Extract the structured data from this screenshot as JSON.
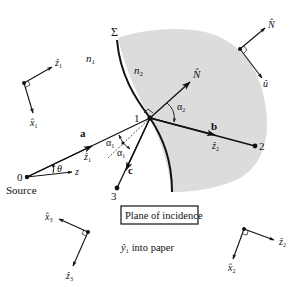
{
  "colors": {
    "ink": "#111111",
    "medium2_fill": "#dcdcdc"
  },
  "labels": {
    "sigma": "Σ",
    "n1": "n",
    "n1_sub": "1",
    "n2": "n",
    "n2_sub": "2",
    "point0": "0",
    "point1": "1",
    "point2": "2",
    "point3": "3",
    "source": "Source",
    "vec_a": "a",
    "vec_b": "b",
    "vec_c": "c",
    "z1_hat": "ẑ",
    "z1_sub": "1",
    "z2_hat": "ẑ",
    "z2_sub": "2",
    "z_axis": "z",
    "theta": "θ",
    "alpha1": "α",
    "alpha1_sub": "1",
    "alpha2": "α",
    "alpha2_sub": "2",
    "N_hat": "N̂",
    "u_hat": "û",
    "plane_of_incidence": "Plane of incidence",
    "y1_into_paper": "into paper",
    "y1_hat": "ŷ",
    "y1_sub": "1"
  },
  "frames": {
    "frame1": {
      "z": "ẑ",
      "z_sub": "1",
      "x": "x̂",
      "x_sub": "1"
    },
    "frameN": {
      "N": "N̂",
      "u": "û"
    },
    "frame3": {
      "x": "x̂",
      "x_sub": "3",
      "z": "ẑ",
      "z_sub": "3"
    },
    "frame2": {
      "z": "ẑ",
      "z_sub": "2",
      "x": "x̂",
      "x_sub": "2"
    }
  }
}
